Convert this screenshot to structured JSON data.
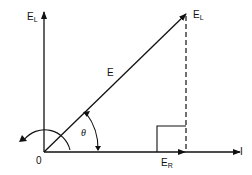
{
  "diagram": {
    "type": "phasor-diagram",
    "labels": {
      "vertical_axis": {
        "main": "E",
        "sub": "L"
      },
      "tip_label": {
        "main": "E",
        "sub": "L"
      },
      "hypotenuse": "E",
      "angle": "θ",
      "origin": "0",
      "resistive": {
        "main": "E",
        "sub": "R"
      },
      "current_axis": "I"
    },
    "colors": {
      "line": "#111111",
      "background": "#ffffff"
    }
  }
}
